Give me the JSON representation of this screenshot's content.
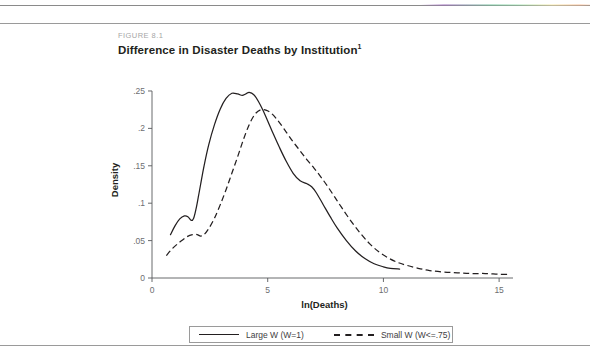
{
  "figure": {
    "label": "FIGURE 8.1",
    "title": "Difference in Disaster Deaths by Institution",
    "title_superscript": "1"
  },
  "colors": {
    "ink": "#231f20",
    "axis": "#58595b",
    "tick_text": "#6d6e71",
    "figure_label": "#a6a6a6",
    "rule": "#8a8a8a"
  },
  "legend": {
    "items": [
      {
        "label": "Large W (W=1)",
        "style": "solid"
      },
      {
        "label": "Small W (W<=.75)",
        "style": "dashed"
      }
    ]
  },
  "chart_data": {
    "type": "line",
    "title": "Difference in Disaster Deaths by Institution",
    "xlabel": "ln(Deaths)",
    "ylabel": "Density",
    "xlim": [
      0,
      15.6
    ],
    "ylim": [
      0,
      0.262
    ],
    "xticks": [
      0,
      5,
      10,
      15
    ],
    "xtick_labels": [
      "0",
      "5",
      "10",
      "15"
    ],
    "yticks": [
      0,
      0.05,
      0.1,
      0.15,
      0.2,
      0.25
    ],
    "ytick_labels": [
      "0",
      ".05",
      ".1",
      ".15",
      ".2",
      ".25"
    ],
    "grid": false,
    "legend_position": "bottom",
    "series": [
      {
        "name": "Large W (W=1)",
        "style": "solid",
        "x": [
          0.8,
          1.0,
          1.2,
          1.4,
          1.55,
          1.7,
          1.8,
          1.9,
          2.0,
          2.1,
          2.25,
          2.45,
          2.7,
          2.95,
          3.2,
          3.45,
          3.7,
          3.9,
          4.05,
          4.2,
          4.4,
          4.6,
          4.8,
          5.0,
          5.25,
          5.5,
          5.8,
          6.1,
          6.4,
          6.7,
          6.9,
          7.1,
          7.4,
          7.7,
          8.0,
          8.4,
          8.8,
          9.2,
          9.6,
          10.0,
          10.3,
          10.7
        ],
        "y": [
          0.058,
          0.07,
          0.079,
          0.083,
          0.082,
          0.077,
          0.08,
          0.092,
          0.108,
          0.125,
          0.15,
          0.178,
          0.205,
          0.226,
          0.24,
          0.247,
          0.246,
          0.244,
          0.246,
          0.248,
          0.245,
          0.236,
          0.224,
          0.21,
          0.192,
          0.175,
          0.156,
          0.14,
          0.13,
          0.126,
          0.122,
          0.114,
          0.098,
          0.082,
          0.067,
          0.05,
          0.036,
          0.026,
          0.019,
          0.015,
          0.013,
          0.012
        ]
      },
      {
        "name": "Small W (W<=.75)",
        "style": "dashed",
        "x": [
          0.62,
          0.9,
          1.2,
          1.5,
          1.75,
          1.95,
          2.1,
          2.25,
          2.45,
          2.7,
          2.95,
          3.2,
          3.45,
          3.7,
          3.95,
          4.2,
          4.45,
          4.7,
          4.95,
          5.2,
          5.5,
          5.8,
          6.1,
          6.4,
          6.7,
          7.0,
          7.3,
          7.6,
          7.9,
          8.2,
          8.6,
          9.0,
          9.4,
          9.8,
          10.2,
          10.6,
          11.0,
          11.5,
          12.0,
          12.6,
          13.2,
          13.8,
          14.4,
          15.0,
          15.4
        ],
        "y": [
          0.03,
          0.04,
          0.048,
          0.055,
          0.058,
          0.058,
          0.056,
          0.058,
          0.066,
          0.08,
          0.098,
          0.118,
          0.14,
          0.162,
          0.185,
          0.205,
          0.219,
          0.225,
          0.224,
          0.219,
          0.208,
          0.195,
          0.182,
          0.17,
          0.158,
          0.147,
          0.135,
          0.122,
          0.108,
          0.094,
          0.076,
          0.06,
          0.046,
          0.035,
          0.027,
          0.021,
          0.017,
          0.013,
          0.01,
          0.008,
          0.007,
          0.006,
          0.006,
          0.005,
          0.005
        ]
      }
    ]
  }
}
